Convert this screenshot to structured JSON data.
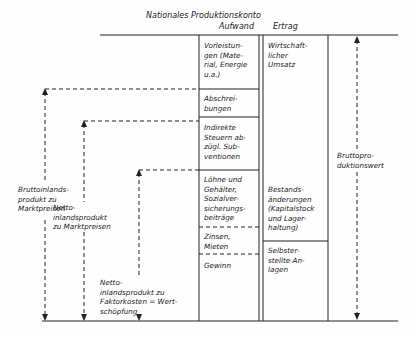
{
  "title": "Nationales Produktionskonto",
  "columns": {
    "left": "Aufwand",
    "right": "Ertrag"
  },
  "aufwand": [
    "Vorleistun-\ngen (Mate-\nrial, Energie\nu.a.)",
    "Abschrei-\nbungen",
    "Indirekte\nSteuern ab-\nzügl. Sub-\nventionen",
    "Löhne und\nGehälter,\nSozialver-\nsicherungs-\nbeiträge",
    "Zinsen,\nMieten",
    "Gewinn"
  ],
  "ertrag": [
    "Wirtschaft-\nlicher\nUmsatz",
    "Bestands-\nänderungen\n(Kapitalstock\nund Lager-\nhaltung)",
    "Selbster-\nstellte An-\nlagen"
  ],
  "aggregates": {
    "bip": "Bruttoinlands-\nprodukt zu\nMarktpreisen",
    "nip_markt": "Netto-\ninlandsprodukt\nzu Marktpreisen",
    "nip_faktor": "Netto-\ninlandsprodukt zu\nFaktorkosten = Wert-\nschöpfung",
    "bpw": "Bruttopro-\nduktionswert"
  }
}
